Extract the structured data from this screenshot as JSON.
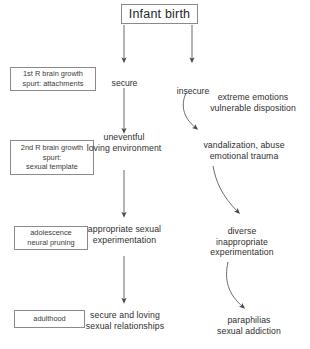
{
  "diagram": {
    "title": "Infant birth",
    "background_color": "#ffffff",
    "line_color": "#5a5a5a",
    "box_border_color": "#8a8a8a",
    "text_color": "#2e2e2e"
  },
  "root": {
    "label": "Infant birth"
  },
  "branches": {
    "secure": "secure",
    "insecure": "insecure"
  },
  "stages": [
    {
      "label": "1st R brain growth\nspurt: attachments"
    },
    {
      "label": "2nd R brain growth\nspurt:\nsexual template"
    },
    {
      "label": "adolescence\nneural pruning"
    },
    {
      "label": "adulthood"
    }
  ],
  "secure_path": [
    {
      "label": "uneventful\nloving environment"
    },
    {
      "label": "appropriate sexual\nexperimentation"
    },
    {
      "label": "secure and loving\nsexual relationships"
    }
  ],
  "insecure_path": [
    {
      "label": "extreme emotions\nvulnerable disposition"
    },
    {
      "label": "vandalization, abuse\nemotional trauma"
    },
    {
      "label": "diverse\ninappropriate\nexperimentation"
    },
    {
      "label": "paraphilias\nsexual addiction"
    }
  ]
}
